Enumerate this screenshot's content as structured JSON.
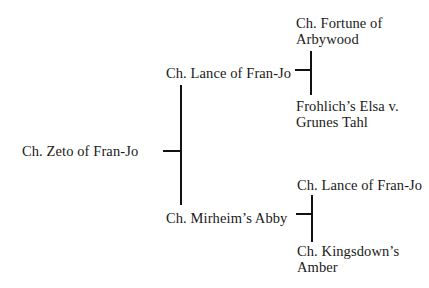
{
  "pedigree": {
    "subject": {
      "name": "Ch. Zeto of Fran-Jo"
    },
    "sire": {
      "name": "Ch. Lance of Fran-Jo",
      "sire": {
        "lines": [
          "Ch. Fortune of",
          "Arbywood"
        ]
      },
      "dam": {
        "lines": [
          "Frohlich’s Elsa v.",
          "Grunes Tahl"
        ]
      }
    },
    "dam": {
      "name": "Ch. Mirheim’s Abby",
      "sire": {
        "lines": [
          "Ch. Lance of Fran-Jo"
        ]
      },
      "dam": {
        "lines": [
          "Ch. Kingsdown’s",
          "Amber"
        ]
      }
    }
  }
}
